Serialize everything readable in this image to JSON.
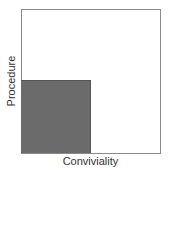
{
  "diagram": {
    "x_axis_label": "Conviviality",
    "y_axis_label": "Procedure",
    "frame_color": "#8a8a8a",
    "shaded_region": {
      "position": "lower-left",
      "x_fraction": 0.5,
      "y_fraction": 0.5,
      "color": "#6b6b6b"
    }
  }
}
